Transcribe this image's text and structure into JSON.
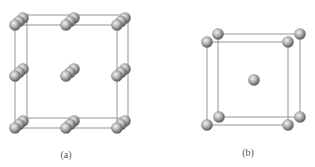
{
  "figure": {
    "panels": [
      {
        "id": "a",
        "label": "(a)",
        "description": "Unit cell with atom stacks (rows of three overlapping spheres) at corners, edge midpoints and center",
        "front_square": {
          "x1": 15,
          "y1": 25,
          "x2": 117,
          "y2": 128
        },
        "back_square": {
          "x1": 27,
          "y1": 15,
          "x2": 128,
          "y2": 118
        },
        "stacks": [
          {
            "x": 15,
            "y": 25
          },
          {
            "x": 66,
            "y": 25
          },
          {
            "x": 117,
            "y": 25
          },
          {
            "x": 15,
            "y": 76
          },
          {
            "x": 66,
            "y": 76
          },
          {
            "x": 117,
            "y": 76
          },
          {
            "x": 15,
            "y": 128
          },
          {
            "x": 66,
            "y": 128
          },
          {
            "x": 117,
            "y": 128
          }
        ]
      },
      {
        "id": "b",
        "label": "(b)",
        "description": "Body-centered cubic unit cell with corner atoms and one central atom",
        "front_square": {
          "x1": 207,
          "y1": 42,
          "x2": 288,
          "y2": 125
        },
        "back_square": {
          "x1": 218,
          "y1": 34,
          "x2": 300,
          "y2": 117
        },
        "center_atom": {
          "x": 254,
          "y": 80
        }
      }
    ],
    "colors": {
      "sphere_light": "#e8e8e8",
      "sphere_mid": "#a8a8a8",
      "sphere_dark": "#5a5a5a",
      "edge": "#8a8a8a",
      "label": "#555555"
    }
  }
}
